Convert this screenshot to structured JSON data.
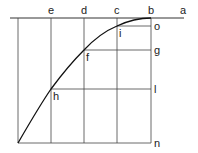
{
  "diagram": {
    "top_labels": [
      {
        "text": "e",
        "x": 51
      },
      {
        "text": "d",
        "x": 84
      },
      {
        "text": "c",
        "x": 117
      },
      {
        "text": "b",
        "x": 151
      },
      {
        "text": "a",
        "x": 183
      }
    ],
    "right_labels": [
      {
        "text": "o",
        "y": 26
      },
      {
        "text": "g",
        "y": 50
      },
      {
        "text": "l",
        "y": 89
      },
      {
        "text": "n",
        "y": 143
      }
    ],
    "point_labels": [
      {
        "text": "i",
        "x": 119,
        "y": 34
      },
      {
        "text": "f",
        "x": 86,
        "y": 58
      },
      {
        "text": "h",
        "x": 53,
        "y": 97
      }
    ],
    "colors": {
      "line": "#333333",
      "curve": "#111111"
    }
  }
}
